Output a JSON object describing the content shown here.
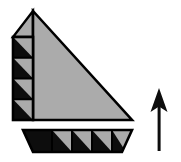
{
  "figure": {
    "name": "hatched-triangle-with-direction-arrow",
    "canvas": {
      "width": 181,
      "height": 162,
      "background": "#ffffff"
    },
    "colors": {
      "fill_gray": "#ababab",
      "hatch_black": "#0d0d0d",
      "outline": "#000000",
      "background": "#ffffff"
    },
    "parts": {
      "main_triangle": {
        "label": "main-gray-right-triangle",
        "apex": [
          33,
          11
        ],
        "bottom_right": [
          132,
          120
        ],
        "bottom_left": [
          33,
          120
        ],
        "fill": "#ababab"
      },
      "apex_cap": {
        "label": "apex-cap-wedge",
        "points": "33,11 33,37 13,37",
        "fill": "#ababab"
      },
      "left_column": {
        "label": "left-hatched-column",
        "x": 13,
        "y": 37,
        "width": 20,
        "height": 83,
        "cell_count": 4,
        "cell_pattern": "black-lower-left-triangle-gray-upper-right"
      },
      "bottom_bar": {
        "label": "bottom-hatched-trapezoid-bar",
        "top_left": [
          23,
          130
        ],
        "top_right": [
          132,
          130
        ],
        "bottom_right": [
          122,
          152
        ],
        "bottom_left": [
          33,
          152
        ],
        "cell_count": 4,
        "end_cell": "solid-gray-trapezoid",
        "cell_pattern": "black-lower-left-triangle-gray-upper-right"
      },
      "arrow": {
        "label": "direction-arrow-up",
        "direction": "up",
        "tip": [
          159,
          88
        ],
        "tail": [
          159,
          151
        ],
        "head_width": 17,
        "head_height": 24,
        "shaft_width": 3,
        "color": "#0d0d0d"
      }
    }
  }
}
